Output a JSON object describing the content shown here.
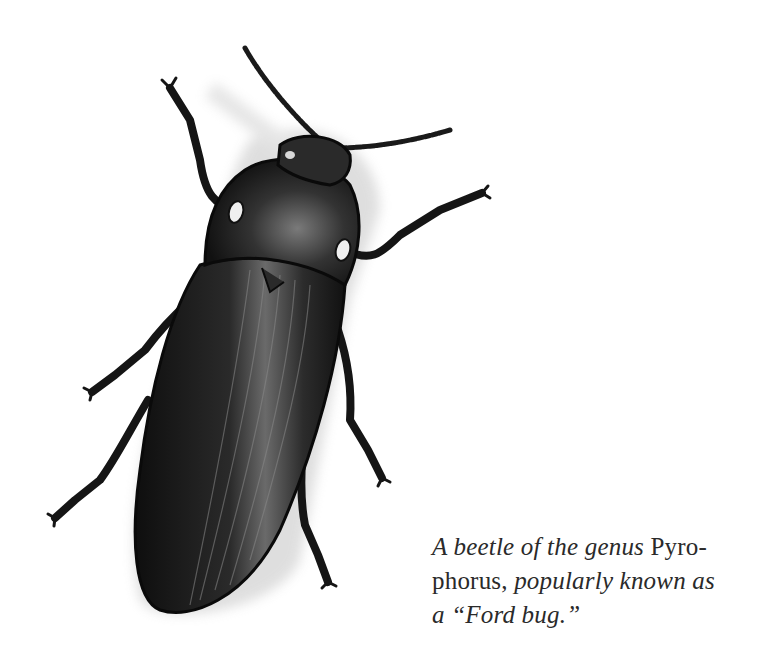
{
  "figure": {
    "style": "pencil drawing, grayscale",
    "colors": {
      "background": "#ffffff",
      "body_dark": "#1a1a1a",
      "body_mid": "#3a3a3a",
      "shading": "#bdbdbd",
      "eye_spot": "#e8e8e8"
    }
  },
  "caption": {
    "part1_italic": "A beetle of the genus ",
    "part2_roman": "Pyro-phorus,",
    "part3_italic": " popularly known as a “Ford bug.”",
    "line1_italic": "A beetle of the genus ",
    "line1_roman": "Pyro-",
    "line2_roman": "phorus, ",
    "line2_italic": "popularly known as",
    "line3_italic": "a “Ford bug.”"
  }
}
